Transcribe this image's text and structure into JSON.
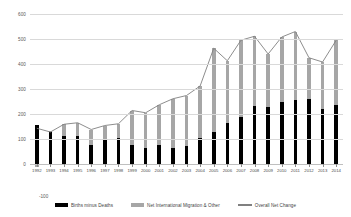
{
  "chart_data": {
    "type": "bar",
    "subtype": "stacked-column-with-line",
    "title": "",
    "xlabel": "",
    "ylabel": "",
    "ylim": [
      -100,
      600
    ],
    "yticks": [
      -100,
      0,
      100,
      200,
      300,
      400,
      500,
      600
    ],
    "ytick_labels": [
      "-100",
      "0",
      "100",
      "200",
      "300",
      "400",
      "500",
      "600"
    ],
    "grid": true,
    "grid_axis": "y",
    "legend_position": "bottom",
    "categories": [
      "1992",
      "1993",
      "1994",
      "1995",
      "1996",
      "1997",
      "1998",
      "1999",
      "2000",
      "2001",
      "2002",
      "2003",
      "2004",
      "2005",
      "2006",
      "2007",
      "2008",
      "2009",
      "2010",
      "2011",
      "2012",
      "2013",
      "2014"
    ],
    "series": [
      {
        "name": "Births minus Deaths",
        "type": "bar",
        "color": "#000000",
        "values": [
          155,
          128,
          112,
          112,
          76,
          102,
          103,
          76,
          66,
          75,
          65,
          74,
          106,
          128,
          163,
          190,
          233,
          228,
          248,
          258,
          260,
          222,
          238
        ]
      },
      {
        "name": "Net International Migration & Other",
        "type": "bar",
        "color": "#A6A6A6",
        "values": [
          -12,
          0,
          47,
          53,
          62,
          52,
          58,
          138,
          139,
          162,
          196,
          200,
          206,
          335,
          250,
          305,
          278,
          212,
          260,
          272,
          165,
          186,
          257
        ]
      },
      {
        "name": "Overall Net Change",
        "type": "line",
        "color": "#808080",
        "values": [
          143,
          128,
          159,
          165,
          138,
          154,
          161,
          214,
          205,
          237,
          261,
          274,
          312,
          463,
          413,
          495,
          511,
          440,
          508,
          530,
          425,
          408,
          495
        ]
      }
    ],
    "legend": [
      "Births minus Deaths",
      "Net International Migration & Other",
      "Overall Net Change"
    ]
  }
}
